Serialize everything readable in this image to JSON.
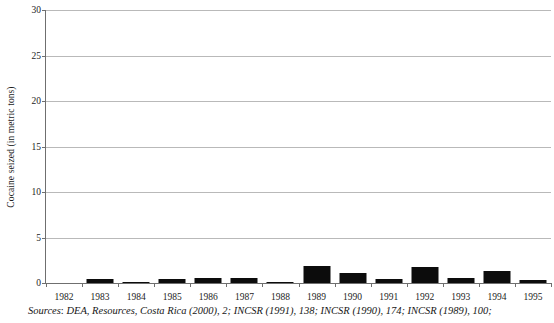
{
  "chart_data": {
    "type": "bar",
    "title": "",
    "subtitle": "",
    "xlabel": "",
    "ylabel": "Cocaine seized (in metric tons)",
    "categories": [
      "1982",
      "1983",
      "1984",
      "1985",
      "1986",
      "1987",
      "1988",
      "1989",
      "1990",
      "1991",
      "1992",
      "1993",
      "1994",
      "1995"
    ],
    "values": [
      0,
      0.4,
      0.15,
      0.45,
      0.6,
      0.6,
      0.15,
      1.85,
      1.1,
      0.4,
      1.8,
      0.5,
      1.35,
      0.35
    ],
    "series": [
      {
        "name": "Cocaine seized",
        "values": [
          0,
          0.4,
          0.15,
          0.45,
          0.6,
          0.6,
          0.15,
          1.85,
          1.1,
          0.4,
          1.8,
          0.5,
          1.35,
          0.35
        ]
      }
    ],
    "ylim": [
      0,
      30
    ],
    "yticks": [
      0,
      5,
      10,
      15,
      20,
      25,
      30
    ],
    "ytick_labels": [
      "0",
      "5",
      "10",
      "15",
      "20",
      "25",
      "30"
    ],
    "grid": true,
    "legend": false,
    "legend_position": "none",
    "bar_color": "#0c0c0c",
    "gridline_color": "#b9b9b9",
    "axis_color": "#6f6f6f"
  },
  "caption": {
    "prefix": "Sources",
    "text": ": DEA, Resources, Costa Rica (2000), 2; INCSR (1991), 138; INCSR (1990), 174; INCSR (1989), 100;"
  }
}
